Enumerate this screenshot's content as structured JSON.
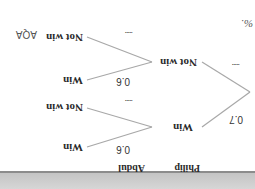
{
  "document": {
    "orientation": "rotated 180 degrees",
    "headers": {
      "first": "Philip",
      "second": "Abdul"
    },
    "tree": {
      "philip": [
        {
          "label": "Win",
          "probability": "0.7"
        },
        {
          "label": "Not win",
          "probability": "....."
        }
      ],
      "abdul_after_win": [
        {
          "label": "Win",
          "probability": "0.6"
        },
        {
          "label": "Not win",
          "probability": "....."
        }
      ],
      "abdul_after_not_win": [
        {
          "label": "Win",
          "probability": "0.6"
        },
        {
          "label": "Not win",
          "probability": "....."
        }
      ]
    },
    "footer_mark": "AQA",
    "corner_text": "%."
  },
  "colors": {
    "line": "#a0a0a0",
    "text": "#2a2a2a",
    "band": "#cfcfcf"
  }
}
